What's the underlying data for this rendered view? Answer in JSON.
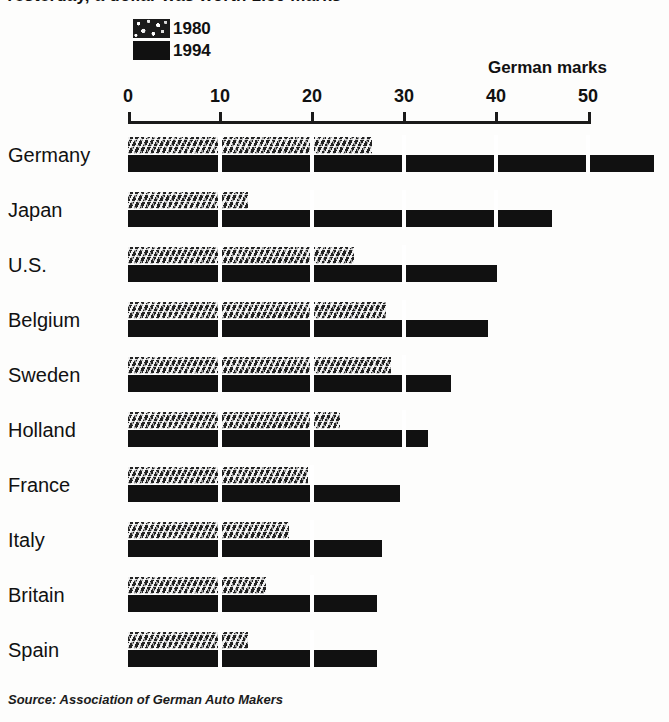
{
  "headline": {
    "text": "Yesterday, a dollar was worth 1.50 marks"
  },
  "legend": {
    "items": [
      {
        "label": "1980",
        "pattern": "textured",
        "color": "#232323"
      },
      {
        "label": "1994",
        "pattern": "solid",
        "color": "#111111"
      }
    ]
  },
  "units_caption": "German marks",
  "source": "Source: Association of German Auto Makers",
  "axis": {
    "ticks": [
      "0",
      "10",
      "20",
      "30",
      "40",
      "50"
    ]
  },
  "chart_data": {
    "type": "bar",
    "orientation": "horizontal",
    "title": "Yesterday, a dollar was worth 1.50 marks",
    "xlabel": "German marks",
    "ylabel": "",
    "xlim": [
      0,
      50
    ],
    "xticks": [
      0,
      10,
      20,
      30,
      40,
      50
    ],
    "grid": false,
    "legend_position": "top-left",
    "categories": [
      "Germany",
      "Japan",
      "U.S.",
      "Belgium",
      "Sweden",
      "Holland",
      "France",
      "Italy",
      "Britain",
      "Spain"
    ],
    "series": [
      {
        "name": "1980",
        "color": "#232323",
        "values": [
          26.5,
          13.0,
          24.5,
          28.0,
          28.5,
          23.0,
          19.5,
          17.5,
          15.0,
          13.0
        ]
      },
      {
        "name": "1994",
        "color": "#111111",
        "values": [
          57.0,
          46.0,
          40.0,
          39.0,
          35.0,
          32.5,
          29.5,
          27.5,
          27.0,
          27.0
        ]
      }
    ],
    "source": "Source: Association of German Auto Makers"
  }
}
